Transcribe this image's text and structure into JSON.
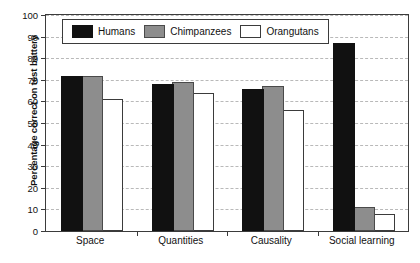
{
  "chart_data": {
    "type": "bar",
    "title": "",
    "xlabel": "",
    "ylabel": "Percentage correct on test battery",
    "ylim": [
      0,
      100
    ],
    "ytick_step": 10,
    "yticks": [
      0,
      10,
      20,
      30,
      40,
      50,
      60,
      70,
      80,
      90,
      100
    ],
    "grid": true,
    "grid_axis": "y",
    "grid_style": "dashed",
    "legend_position": "top-left-inside",
    "categories": [
      "Space",
      "Quantities",
      "Causality",
      "Social learning"
    ],
    "series": [
      {
        "name": "Humans",
        "color": "#111111",
        "values": [
          71,
          67,
          65,
          86
        ]
      },
      {
        "name": "Chimpanzees",
        "color": "#8d8d8d",
        "values": [
          71,
          68,
          66,
          10
        ]
      },
      {
        "name": "Orangutans",
        "color": "#ffffff",
        "values": [
          60,
          63,
          55,
          7
        ]
      }
    ]
  },
  "legend": {
    "items": [
      {
        "label": "Humans",
        "key": "humans"
      },
      {
        "label": "Chimpanzees",
        "key": "chimps"
      },
      {
        "label": "Orangutans",
        "key": "orangs"
      }
    ]
  },
  "axis": {
    "y_title": "Percentage correct on test battery",
    "y_tick_labels": [
      "100",
      "90",
      "80",
      "70",
      "60",
      "50",
      "40",
      "30",
      "20",
      "10",
      "0"
    ],
    "x_tick_labels": [
      "Space",
      "Quantities",
      "Causality",
      "Social learning"
    ]
  },
  "colors": {
    "humans": "#111111",
    "chimpanzees": "#8d8d8d",
    "orangutans": "#ffffff",
    "axis": "#3b3b3b",
    "grid": "#b9b9b9",
    "background": "#ffffff"
  }
}
